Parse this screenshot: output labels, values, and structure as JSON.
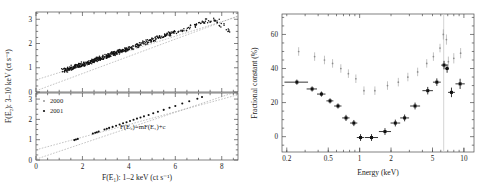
{
  "figure": {
    "left_panel": {
      "xlabel": "F(E₁): 1–2 keV (ct s⁻¹)",
      "ylabel": "F(E₂): 3–10 keV (ct s⁻¹)",
      "equation": "F(E₂)=mF(E₁)+c",
      "legend": [
        {
          "label": "2000",
          "marker": "dot-grey"
        },
        {
          "label": "2001",
          "marker": "dot-dark"
        }
      ],
      "xticks": [
        "0",
        "2",
        "4",
        "6",
        "8"
      ],
      "yticks_top": [
        "0",
        "1",
        "2",
        "3"
      ],
      "yticks_bottom": [
        "0",
        "1",
        "2",
        "3"
      ]
    },
    "right_panel": {
      "xlabel": "Energy (keV)",
      "ylabel": "Fractional constant (%)",
      "xticks": [
        "0.2",
        "0.5",
        "1",
        "2",
        "5",
        "10"
      ],
      "yticks": [
        "0",
        "20",
        "40",
        "60"
      ]
    }
  },
  "chart_data": [
    {
      "type": "scatter",
      "panel": "left-top",
      "title": "",
      "xlabel": "F(E₁): 1–2 keV (ct s⁻¹)",
      "ylabel": "F(E₂): 3–10 keV (ct s⁻¹)",
      "xlim": [
        0,
        8.7
      ],
      "ylim": [
        0,
        3.3
      ],
      "grid": false,
      "legend_position": "none",
      "series": [
        {
          "name": "2000",
          "marker": "filled-circle",
          "color": "#111111",
          "points": [
            [
              1.2,
              0.88
            ],
            [
              1.25,
              0.9
            ],
            [
              1.3,
              0.92
            ],
            [
              1.35,
              0.93
            ],
            [
              1.4,
              0.95
            ],
            [
              1.45,
              0.97
            ],
            [
              1.5,
              0.99
            ],
            [
              1.55,
              1.0
            ],
            [
              1.6,
              1.02
            ],
            [
              1.65,
              1.04
            ],
            [
              1.7,
              1.05
            ],
            [
              1.75,
              1.07
            ],
            [
              1.8,
              1.08
            ],
            [
              1.85,
              1.1
            ],
            [
              1.9,
              1.11
            ],
            [
              1.95,
              1.13
            ],
            [
              2.0,
              1.14
            ],
            [
              2.05,
              1.16
            ],
            [
              2.1,
              1.17
            ],
            [
              2.15,
              1.19
            ],
            [
              2.2,
              1.2
            ],
            [
              2.25,
              1.22
            ],
            [
              2.3,
              1.24
            ],
            [
              2.35,
              1.25
            ],
            [
              2.4,
              1.27
            ],
            [
              2.45,
              1.28
            ],
            [
              2.5,
              1.3
            ],
            [
              2.55,
              1.32
            ],
            [
              2.6,
              1.33
            ],
            [
              2.65,
              1.35
            ],
            [
              2.7,
              1.37
            ],
            [
              2.75,
              1.38
            ],
            [
              2.8,
              1.4
            ],
            [
              2.85,
              1.42
            ],
            [
              2.9,
              1.43
            ],
            [
              2.95,
              1.45
            ],
            [
              3.0,
              1.47
            ],
            [
              3.05,
              1.48
            ],
            [
              3.1,
              1.5
            ],
            [
              3.15,
              1.52
            ],
            [
              3.2,
              1.53
            ],
            [
              3.25,
              1.55
            ],
            [
              3.3,
              1.57
            ],
            [
              3.35,
              1.58
            ],
            [
              3.4,
              1.6
            ],
            [
              3.45,
              1.62
            ],
            [
              3.5,
              1.63
            ],
            [
              3.55,
              1.65
            ],
            [
              3.6,
              1.67
            ],
            [
              3.65,
              1.68
            ],
            [
              3.7,
              1.7
            ],
            [
              3.75,
              1.72
            ],
            [
              3.8,
              1.73
            ],
            [
              3.85,
              1.75
            ],
            [
              3.9,
              1.77
            ],
            [
              3.95,
              1.78
            ],
            [
              4.0,
              1.8
            ],
            [
              4.1,
              1.83
            ],
            [
              4.2,
              1.87
            ],
            [
              4.3,
              1.9
            ],
            [
              4.4,
              1.93
            ],
            [
              4.5,
              1.97
            ],
            [
              4.6,
              2.0
            ],
            [
              4.7,
              2.03
            ],
            [
              4.8,
              2.07
            ],
            [
              4.9,
              2.1
            ],
            [
              5.0,
              2.13
            ],
            [
              5.1,
              2.17
            ],
            [
              5.2,
              2.2
            ],
            [
              5.3,
              2.23
            ],
            [
              5.4,
              2.27
            ],
            [
              5.5,
              2.3
            ],
            [
              5.6,
              2.33
            ],
            [
              5.7,
              2.37
            ],
            [
              5.8,
              2.4
            ],
            [
              5.9,
              2.43
            ],
            [
              6.0,
              2.47
            ],
            [
              6.2,
              2.53
            ],
            [
              6.4,
              2.6
            ],
            [
              6.6,
              2.67
            ],
            [
              6.8,
              2.73
            ],
            [
              7.0,
              2.8
            ],
            [
              7.2,
              2.87
            ],
            [
              7.4,
              2.93
            ],
            [
              7.6,
              2.97
            ],
            [
              7.8,
              2.93
            ],
            [
              8.0,
              2.75
            ],
            [
              8.3,
              2.55
            ]
          ]
        }
      ],
      "fit_lines": [
        {
          "name": "fit-steep",
          "slope": 0.355,
          "intercept": 0.05,
          "style": "dotted"
        },
        {
          "name": "fit-shallow",
          "slope": 0.3,
          "intercept": 0.5,
          "style": "dotted"
        }
      ]
    },
    {
      "type": "scatter",
      "panel": "left-bottom",
      "title": "",
      "xlabel": "F(E₁): 1–2 keV (ct s⁻¹)",
      "ylabel": "F(E₂): 3–10 keV (ct s⁻¹)",
      "xlim": [
        0,
        8.7
      ],
      "ylim": [
        0,
        3.3
      ],
      "grid": false,
      "legend_position": "upper-left",
      "series": [
        {
          "name": "2001",
          "marker": "filled-circle",
          "color": "#111111",
          "points": [
            [
              1.65,
              0.98
            ],
            [
              1.72,
              1.01
            ],
            [
              1.8,
              1.04
            ],
            [
              2.45,
              1.3
            ],
            [
              2.55,
              1.34
            ],
            [
              2.62,
              1.37
            ],
            [
              2.7,
              1.4
            ],
            [
              2.95,
              1.5
            ],
            [
              3.05,
              1.54
            ],
            [
              3.15,
              1.58
            ],
            [
              3.3,
              1.63
            ],
            [
              3.45,
              1.69
            ],
            [
              3.6,
              1.75
            ],
            [
              3.75,
              1.81
            ],
            [
              3.9,
              1.86
            ],
            [
              4.05,
              1.92
            ],
            [
              4.2,
              1.98
            ],
            [
              4.35,
              2.04
            ],
            [
              4.5,
              2.09
            ],
            [
              4.65,
              2.15
            ],
            [
              4.85,
              2.22
            ],
            [
              5.05,
              2.3
            ],
            [
              5.25,
              2.38
            ],
            [
              5.5,
              2.47
            ],
            [
              5.75,
              2.57
            ],
            [
              6.0,
              2.66
            ],
            [
              6.3,
              2.78
            ],
            [
              6.6,
              2.89
            ],
            [
              6.95,
              3.02
            ],
            [
              7.15,
              3.1
            ]
          ]
        }
      ],
      "fit_lines": [
        {
          "name": "fit-steep",
          "slope": 0.385,
          "intercept": 0.04,
          "style": "dotted"
        },
        {
          "name": "fit-shallow",
          "slope": 0.312,
          "intercept": 0.5,
          "style": "dotted"
        }
      ],
      "annotations": [
        {
          "text": "F(E₂)=mF(E₁)+c",
          "x": 4.6,
          "y": 1.55
        }
      ]
    },
    {
      "type": "scatter",
      "panel": "right",
      "title": "",
      "xlabel": "Energy (keV)",
      "ylabel": "Fractional constant (%)",
      "xscale": "log",
      "xlim": [
        0.18,
        12.5
      ],
      "ylim": [
        -9,
        72
      ],
      "grid": false,
      "legend_position": "none",
      "vertical_marker": {
        "x": 6.4,
        "color": "#c8c8c8"
      },
      "series": [
        {
          "name": "2001",
          "marker": "filled-square",
          "color": "#111111",
          "points": [
            {
              "x": 0.25,
              "y": 32,
              "xerr_lo": 0.06,
              "xerr_hi": 0.07,
              "yerr": 1.5
            },
            {
              "x": 0.35,
              "y": 28,
              "xerr_lo": 0.04,
              "xerr_hi": 0.04,
              "yerr": 1.5
            },
            {
              "x": 0.43,
              "y": 25,
              "xerr_lo": 0.04,
              "xerr_hi": 0.04,
              "yerr": 1.5
            },
            {
              "x": 0.52,
              "y": 21,
              "xerr_lo": 0.04,
              "xerr_hi": 0.04,
              "yerr": 1.5
            },
            {
              "x": 0.62,
              "y": 18,
              "xerr_lo": 0.05,
              "xerr_hi": 0.05,
              "yerr": 1.5
            },
            {
              "x": 0.74,
              "y": 11,
              "xerr_lo": 0.06,
              "xerr_hi": 0.06,
              "yerr": 1.8
            },
            {
              "x": 0.88,
              "y": 8,
              "xerr_lo": 0.07,
              "xerr_hi": 0.07,
              "yerr": 1.8
            },
            {
              "x": 1.02,
              "y": -0.5,
              "xerr_lo": 0.08,
              "xerr_hi": 0.08,
              "yerr": 2.0
            },
            {
              "x": 1.3,
              "y": -0.5,
              "xerr_lo": 0.18,
              "xerr_hi": 0.2,
              "yerr": 2.0
            },
            {
              "x": 1.75,
              "y": 3,
              "xerr_lo": 0.22,
              "xerr_hi": 0.25,
              "yerr": 2.0
            },
            {
              "x": 2.2,
              "y": 8,
              "xerr_lo": 0.22,
              "xerr_hi": 0.25,
              "yerr": 2.0
            },
            {
              "x": 2.7,
              "y": 11,
              "xerr_lo": 0.25,
              "xerr_hi": 0.28,
              "yerr": 2.0
            },
            {
              "x": 3.4,
              "y": 18,
              "xerr_lo": 0.35,
              "xerr_hi": 0.4,
              "yerr": 2.0
            },
            {
              "x": 4.5,
              "y": 27,
              "xerr_lo": 0.5,
              "xerr_hi": 0.55,
              "yerr": 2.2
            },
            {
              "x": 5.5,
              "y": 32,
              "xerr_lo": 0.45,
              "xerr_hi": 0.5,
              "yerr": 2.2
            },
            {
              "x": 6.45,
              "y": 42,
              "xerr_lo": 0.4,
              "xerr_hi": 0.45,
              "yerr": 2.5
            },
            {
              "x": 6.9,
              "y": 40,
              "xerr_lo": 0.3,
              "xerr_hi": 0.3,
              "yerr": 2.5
            },
            {
              "x": 7.6,
              "y": 26,
              "xerr_lo": 0.55,
              "xerr_hi": 0.6,
              "yerr": 2.8
            },
            {
              "x": 9.2,
              "y": 31,
              "xerr_lo": 0.9,
              "xerr_hi": 1.0,
              "yerr": 3.0
            }
          ]
        },
        {
          "name": "2000",
          "marker": "small-point",
          "color": "#9b9b9b",
          "points": [
            {
              "x": 0.26,
              "y": 50,
              "yerr": 2.5
            },
            {
              "x": 0.37,
              "y": 47,
              "yerr": 2.5
            },
            {
              "x": 0.46,
              "y": 45,
              "yerr": 2.5
            },
            {
              "x": 0.55,
              "y": 43,
              "yerr": 2.5
            },
            {
              "x": 0.66,
              "y": 40,
              "yerr": 2.5
            },
            {
              "x": 0.78,
              "y": 37,
              "yerr": 2.5
            },
            {
              "x": 0.92,
              "y": 34,
              "yerr": 2.5
            },
            {
              "x": 1.1,
              "y": 27,
              "yerr": 2.5
            },
            {
              "x": 1.4,
              "y": 27,
              "yerr": 2.5
            },
            {
              "x": 1.85,
              "y": 30,
              "yerr": 2.5
            },
            {
              "x": 2.35,
              "y": 32,
              "yerr": 2.5
            },
            {
              "x": 2.9,
              "y": 35,
              "yerr": 2.5
            },
            {
              "x": 3.6,
              "y": 38,
              "yerr": 2.5
            },
            {
              "x": 4.4,
              "y": 43,
              "yerr": 2.5
            },
            {
              "x": 5.1,
              "y": 47,
              "yerr": 2.5
            },
            {
              "x": 5.9,
              "y": 52,
              "yerr": 2.5
            },
            {
              "x": 6.35,
              "y": 60,
              "yerr": 3.0
            },
            {
              "x": 6.8,
              "y": 57,
              "yerr": 3.0
            },
            {
              "x": 7.1,
              "y": 44,
              "yerr": 3.0
            },
            {
              "x": 8.0,
              "y": 46,
              "yerr": 3.0
            },
            {
              "x": 9.3,
              "y": 49,
              "yerr": 3.0
            }
          ]
        }
      ]
    }
  ]
}
